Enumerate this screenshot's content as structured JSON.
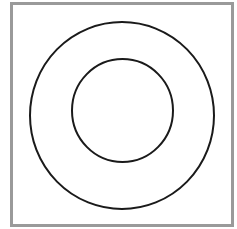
{
  "diagram": {
    "frame": {
      "stroke": "#9a9a9a",
      "fill": "#ffffff"
    },
    "shapes": [
      {
        "name": "outer-circle",
        "cx": 122,
        "cy": 115.5,
        "rx": 92,
        "ry": 93.5,
        "stroke": "#1a1a1a",
        "stroke_width": 2
      },
      {
        "name": "inner-circle",
        "cx": 122.5,
        "cy": 110.5,
        "rx": 50.5,
        "ry": 51.5,
        "stroke": "#1a1a1a",
        "stroke_width": 2
      }
    ]
  }
}
